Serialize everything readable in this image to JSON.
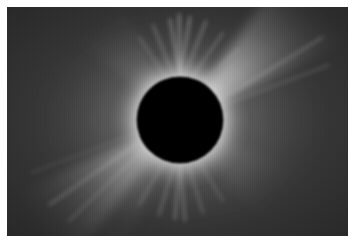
{
  "page": {
    "background_color": "#ffffff",
    "width": 356,
    "height": 251
  },
  "photo": {
    "name": "total-solar-eclipse-corona",
    "alt_text": "Total solar eclipse showing the solar corona around a black lunar disk",
    "frame": {
      "x": 7,
      "y": 7,
      "width": 341,
      "height": 229
    },
    "sky_color": "#2e2e2e",
    "sky_color_outer": "#262626",
    "occulting_disk": {
      "name": "lunar-disk",
      "color": "#000000",
      "center_x": 173,
      "center_y": 113,
      "radius": 42
    },
    "inner_corona": {
      "name": "inner-corona-ring",
      "color": "#ffffff",
      "inner_radius": 42,
      "outer_radius": 62
    },
    "streamers": [
      {
        "name": "streamer-upper-right",
        "angle_deg": 40,
        "length": 175,
        "width_deg": 26,
        "intensity": 0.92
      },
      {
        "name": "streamer-lower-left",
        "angle_deg": 218,
        "length": 170,
        "width_deg": 24,
        "intensity": 0.88
      },
      {
        "name": "streamer-lower-left-secondary",
        "angle_deg": 235,
        "length": 150,
        "width_deg": 16,
        "intensity": 0.7
      },
      {
        "name": "streamer-upper-left",
        "angle_deg": 128,
        "length": 135,
        "width_deg": 20,
        "intensity": 0.62
      },
      {
        "name": "streamer-lower-right",
        "angle_deg": 322,
        "length": 130,
        "width_deg": 20,
        "intensity": 0.58
      }
    ],
    "polar_plumes": {
      "name": "polar-plumes",
      "count": 16,
      "description": "fine radial striations above and below the disk"
    }
  }
}
